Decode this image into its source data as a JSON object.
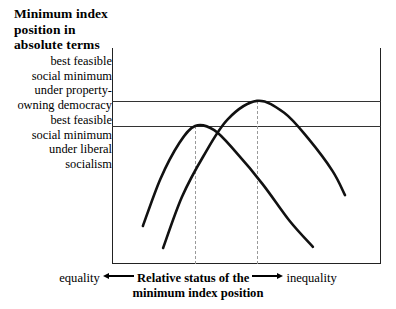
{
  "figure": {
    "title": "Minimum index\nposition in\nabsolute terms",
    "y_annotations": [
      {
        "id": "property-owning-democracy",
        "text": "best feasible\nsocial minimum\nunder property-\nowning democracy",
        "level_value": 0.755
      },
      {
        "id": "liberal-socialism",
        "text": "best feasible\nsocial minimum\nunder liberal\nsocialism",
        "level_value": 0.639
      }
    ],
    "x_axis": {
      "left_label": "equality",
      "center_label_line1": "Relative status of the",
      "center_label_line2": "minimum index position",
      "right_label": "inequality",
      "left_arrow": "arrow-left-icon",
      "right_arrow": "arrow-right-icon"
    },
    "colors": {
      "axis": "#222222",
      "reference_line": "#333333",
      "dashed_guide": "#9a9a9a",
      "curve": "#111111",
      "background": "#ffffff"
    }
  },
  "chart_data": {
    "type": "line",
    "title": "Minimum index position in absolute terms",
    "xlabel": "Relative status of the minimum index position",
    "ylabel": "Minimum index position in absolute terms",
    "xlim": [
      0,
      1
    ],
    "ylim": [
      0,
      1
    ],
    "grid": false,
    "legend": "none",
    "axis_tick_labels": {
      "x": [
        "equality",
        "inequality"
      ],
      "y": []
    },
    "reference_lines": [
      {
        "name": "best feasible social minimum under property-owning democracy",
        "orientation": "horizontal",
        "value": 0.755,
        "style": "solid"
      },
      {
        "name": "best feasible social minimum under liberal socialism",
        "orientation": "horizontal",
        "value": 0.639,
        "style": "solid"
      },
      {
        "name": "optimum for liberal socialism",
        "orientation": "vertical",
        "value": 0.309,
        "style": "dashed"
      },
      {
        "name": "optimum for property-owning democracy",
        "orientation": "vertical",
        "value": 0.539,
        "style": "dashed"
      }
    ],
    "series": [
      {
        "name": "liberal socialism",
        "peak": {
          "x": 0.309,
          "y": 0.639
        },
        "x": [
          0.115,
          0.18,
          0.25,
          0.309,
          0.38,
          0.46,
          0.56,
          0.66,
          0.747
        ],
        "y": [
          0.176,
          0.394,
          0.56,
          0.639,
          0.62,
          0.519,
          0.37,
          0.2,
          0.079
        ]
      },
      {
        "name": "property-owning democracy",
        "peak": {
          "x": 0.539,
          "y": 0.755
        },
        "x": [
          0.19,
          0.26,
          0.34,
          0.43,
          0.539,
          0.64,
          0.73,
          0.82,
          0.866
        ],
        "y": [
          0.074,
          0.31,
          0.5,
          0.67,
          0.755,
          0.7,
          0.58,
          0.43,
          0.319
        ]
      }
    ]
  }
}
